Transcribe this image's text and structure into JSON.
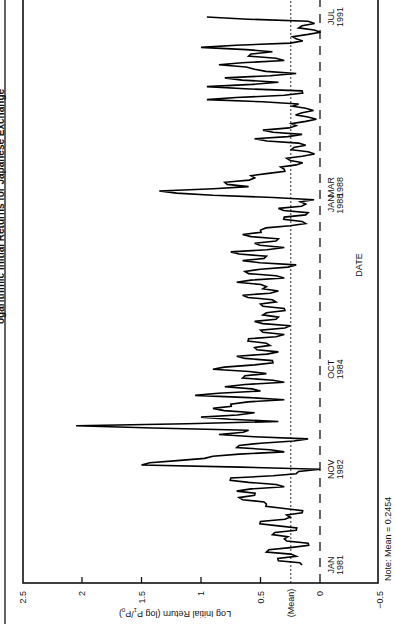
{
  "chart_data": {
    "type": "line",
    "title_visible_fragment": "ogarithmic Initial Returns for Japanese Exchange",
    "xlabel": "DATE",
    "ylabel": "Log Initial Return (log P1/P0)",
    "ylabel_main": "Log Initial Return (log P",
    "ylabel_sub1": "1",
    "ylabel_mid": "/P",
    "ylabel_sub0": "0",
    "ylabel_end": ")",
    "ylim": [
      -0.5,
      2.5
    ],
    "yticks": [
      {
        "value": 2.5,
        "label": "2.5"
      },
      {
        "value": 2,
        "label": "2"
      },
      {
        "value": 1.5,
        "label": "1.5"
      },
      {
        "value": 1,
        "label": "1"
      },
      {
        "value": 0.5,
        "label": "0.5"
      },
      {
        "value": 0,
        "label": "0"
      },
      {
        "value": -0.5,
        "label": "−0.5"
      }
    ],
    "mean": 0.2454,
    "mean_label": "(Mean)",
    "note": "Note: Mean = 0.2454",
    "xticks": [
      {
        "month_index": 0,
        "line1": "JAN",
        "line2": "1981"
      },
      {
        "month_index": 22,
        "line1": "NOV",
        "line2": "1982"
      },
      {
        "month_index": 45,
        "line1": "OCT",
        "line2": "1984"
      },
      {
        "month_index": 84,
        "line1": "JAN",
        "line2": "1988"
      },
      {
        "month_index": 86,
        "line1": "MAR",
        "line2": "1988"
      },
      {
        "month_index": 126,
        "line1": "JUL",
        "line2": "1991"
      }
    ],
    "grid": false,
    "series": [
      {
        "name": "Log initial return",
        "start": "JAN 1981",
        "end": "JUL 1991",
        "x_month": [
          0,
          1,
          2,
          3,
          4,
          5,
          6,
          7,
          8,
          9,
          10,
          11,
          12,
          13,
          14,
          15,
          16,
          17,
          18,
          19,
          20,
          21,
          22,
          23,
          24,
          25,
          26,
          27,
          28,
          29,
          30,
          31,
          32,
          33,
          34,
          35,
          36,
          37,
          38,
          39,
          40,
          41,
          42,
          43,
          44,
          45,
          46,
          47,
          48,
          49,
          50,
          51,
          52,
          53,
          54,
          55,
          56,
          57,
          58,
          59,
          60,
          61,
          62,
          63,
          64,
          65,
          66,
          67,
          68,
          69,
          70,
          71,
          72,
          73,
          74,
          75,
          76,
          77,
          78,
          79,
          80,
          81,
          82,
          83,
          84,
          85,
          86,
          87,
          88,
          89,
          90,
          91,
          92,
          93,
          94,
          95,
          96,
          97,
          98,
          99,
          100,
          101,
          102,
          103,
          104,
          105,
          106,
          107,
          108,
          109,
          110,
          111,
          112,
          113,
          114,
          115,
          116,
          117,
          118,
          119,
          120,
          121,
          122,
          123,
          124,
          125,
          126
        ],
        "values": [
          0.15,
          0.35,
          0.2,
          0.45,
          0.25,
          0.1,
          0.3,
          0.4,
          0.2,
          0.35,
          0.5,
          0.25,
          0.15,
          0.3,
          0.45,
          0.65,
          0.55,
          0.7,
          0.3,
          0.6,
          0.75,
          0.2,
          0.0,
          1.5,
          1.2,
          0.9,
          0.3,
          0.7,
          0.5,
          0.1,
          0.85,
          0.6,
          2.05,
          0.35,
          1.0,
          0.55,
          0.9,
          0.75,
          0.3,
          1.05,
          0.5,
          0.8,
          0.3,
          0.65,
          0.45,
          0.9,
          0.55,
          0.4,
          0.7,
          0.35,
          0.55,
          0.45,
          0.6,
          0.3,
          0.5,
          0.25,
          0.55,
          0.35,
          0.45,
          0.3,
          0.5,
          0.4,
          0.65,
          0.35,
          0.45,
          0.7,
          0.3,
          0.6,
          0.5,
          0.2,
          0.65,
          0.45,
          0.75,
          0.3,
          0.55,
          0.35,
          0.65,
          0.5,
          0.25,
          0.15,
          0.3,
          0.1,
          0.35,
          0.12,
          0.05,
          0.9,
          1.35,
          0.6,
          0.8,
          0.55,
          0.45,
          0.3,
          0.2,
          0.25,
          0.15,
          0.1,
          0.22,
          0.18,
          0.55,
          0.15,
          0.48,
          0.2,
          0.12,
          0.1,
          0.15,
          0.12,
          0.18,
          0.95,
          0.3,
          0.15,
          0.95,
          0.35,
          0.8,
          0.2,
          0.55,
          0.85,
          0.3,
          0.6,
          0.4,
          1.0,
          0.25,
          0.2,
          0.1,
          0.05,
          0.15,
          0.1,
          0.95
        ]
      }
    ]
  }
}
